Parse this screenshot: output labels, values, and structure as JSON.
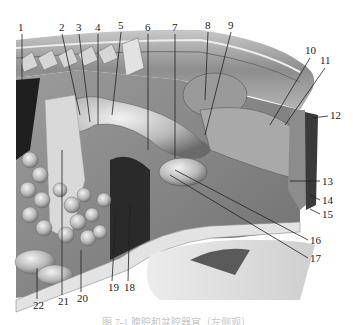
{
  "figure": {
    "type": "anatomical-illustration",
    "background": "#ffffff",
    "palette": {
      "ink": "#222222",
      "dark": "#2a2a2a",
      "mid": "#8a8a8a",
      "light": "#cfcfcf",
      "pale": "#e6e6e6"
    }
  },
  "labels": [
    {
      "id": "1",
      "text": "1",
      "x": 18,
      "y": 22
    },
    {
      "id": "2",
      "text": "2",
      "x": 59,
      "y": 22
    },
    {
      "id": "3",
      "text": "3",
      "x": 76,
      "y": 22
    },
    {
      "id": "4",
      "text": "4",
      "x": 95,
      "y": 22
    },
    {
      "id": "5",
      "text": "5",
      "x": 118,
      "y": 20
    },
    {
      "id": "6",
      "text": "6",
      "x": 145,
      "y": 22
    },
    {
      "id": "7",
      "text": "7",
      "x": 172,
      "y": 22
    },
    {
      "id": "8",
      "text": "8",
      "x": 205,
      "y": 20
    },
    {
      "id": "9",
      "text": "9",
      "x": 228,
      "y": 20
    },
    {
      "id": "10",
      "text": "10",
      "x": 305,
      "y": 45
    },
    {
      "id": "11",
      "text": "11",
      "x": 320,
      "y": 55
    },
    {
      "id": "12",
      "text": "12",
      "x": 330,
      "y": 112
    },
    {
      "id": "13",
      "text": "13",
      "x": 322,
      "y": 177
    },
    {
      "id": "14",
      "text": "14",
      "x": 322,
      "y": 196
    },
    {
      "id": "15",
      "text": "15",
      "x": 322,
      "y": 210
    },
    {
      "id": "16",
      "text": "16",
      "x": 310,
      "y": 236
    },
    {
      "id": "17",
      "text": "17",
      "x": 310,
      "y": 254
    },
    {
      "id": "18",
      "text": "18",
      "x": 124,
      "y": 283
    },
    {
      "id": "19",
      "text": "19",
      "x": 108,
      "y": 283
    },
    {
      "id": "20",
      "text": "20",
      "x": 77,
      "y": 294
    },
    {
      "id": "21",
      "text": "21",
      "x": 58,
      "y": 297
    },
    {
      "id": "22",
      "text": "22",
      "x": 33,
      "y": 301
    }
  ],
  "caption": {
    "text": "图 7-1 腹腔和盆腔器官（左侧观）"
  }
}
